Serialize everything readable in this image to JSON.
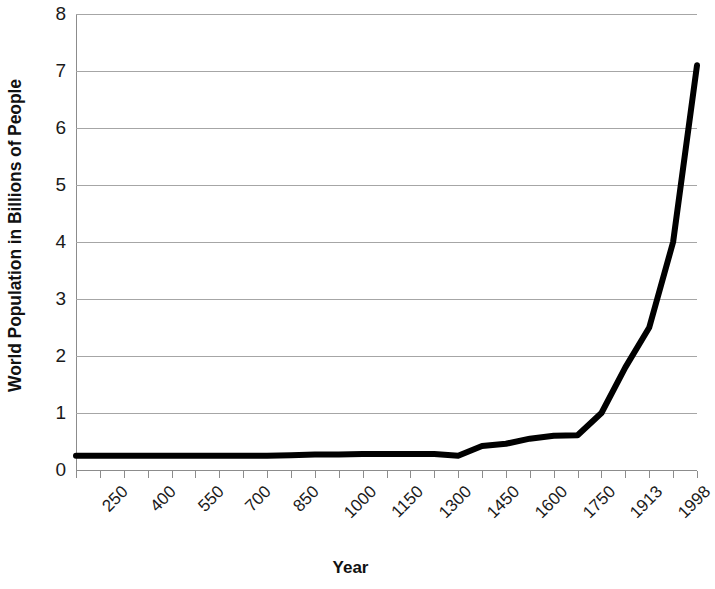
{
  "chart_data": {
    "type": "line",
    "title": "",
    "xlabel": "Year",
    "ylabel": "World Population in Billions of People",
    "ylim": [
      0,
      8
    ],
    "y_ticks": [
      0,
      1,
      2,
      3,
      4,
      5,
      6,
      7,
      8
    ],
    "y_tick_labels": [
      "0",
      "1",
      "2",
      "3",
      "4",
      "5",
      "6",
      "7",
      "8"
    ],
    "grid": true,
    "legend": "none",
    "categories": [
      "250",
      "325",
      "400",
      "475",
      "550",
      "625",
      "700",
      "775",
      "850",
      "925",
      "1000",
      "1075",
      "1150",
      "1225",
      "1300",
      "1375",
      "1450",
      "1525",
      "1600",
      "1675",
      "1750",
      "1830",
      "1913",
      "1950",
      "1975",
      "1998",
      "2012"
    ],
    "x_tick_labels": [
      "250",
      "400",
      "550",
      "700",
      "850",
      "1000",
      "1150",
      "1300",
      "1450",
      "1600",
      "1750",
      "1913",
      "1998"
    ],
    "values": [
      0.25,
      0.25,
      0.25,
      0.25,
      0.25,
      0.25,
      0.25,
      0.25,
      0.25,
      0.26,
      0.27,
      0.27,
      0.28,
      0.28,
      0.28,
      0.28,
      0.25,
      0.42,
      0.46,
      0.55,
      0.6,
      0.61,
      1.0,
      1.8,
      2.5,
      4.0,
      7.1
    ],
    "series_name": "World Population",
    "line_color": "#000000",
    "grid_color": "#a6a6a6",
    "background_color": "#ffffff",
    "final_value": "7.1"
  }
}
